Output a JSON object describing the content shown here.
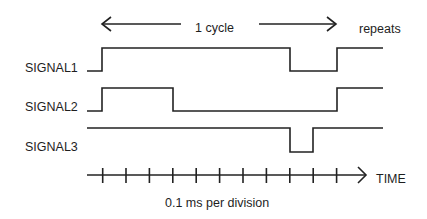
{
  "diagram": {
    "type": "timing-diagram",
    "cycle_label": "1 cycle",
    "repeat_label": "repeats",
    "axis_label": "TIME",
    "scale_label": "0.1 ms per division",
    "tick_count": 11,
    "tick_unit_ms": 0.1,
    "signals": [
      {
        "name": "SIGNAL1",
        "initial": 0,
        "transitions": [
          {
            "t": 0,
            "level": 1
          },
          {
            "t": 8,
            "level": 0
          },
          {
            "t": 10,
            "level": 1
          }
        ]
      },
      {
        "name": "SIGNAL2",
        "initial": 0,
        "transitions": [
          {
            "t": 0,
            "level": 1
          },
          {
            "t": 3,
            "level": 0
          },
          {
            "t": 10,
            "level": 1
          }
        ]
      },
      {
        "name": "SIGNAL3",
        "initial": 1,
        "transitions": [
          {
            "t": 8,
            "level": 0
          },
          {
            "t": 9,
            "level": 1
          }
        ]
      }
    ],
    "stroke_color": "#222222"
  }
}
